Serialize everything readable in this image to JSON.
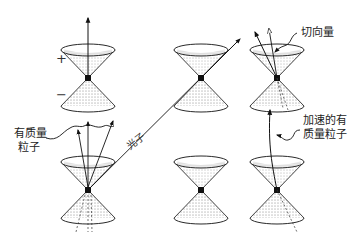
{
  "diagram": {
    "type": "light-cone-diagram",
    "labels": {
      "future_sign": "+",
      "past_sign": "−",
      "massive_particle_line1": "有质量",
      "massive_particle_line2": "粒子",
      "photon": "光子",
      "tangent_vector": "切向量",
      "accelerated_line1": "加速的有",
      "accelerated_line2": "质量粒子"
    },
    "cones": [
      {
        "id": "top-left",
        "vertex": [
          88,
          78
        ]
      },
      {
        "id": "top-middle",
        "vertex": [
          201,
          78
        ]
      },
      {
        "id": "top-right",
        "vertex": [
          277,
          78
        ]
      },
      {
        "id": "bottom-left",
        "vertex": [
          88,
          190
        ]
      },
      {
        "id": "bottom-middle",
        "vertex": [
          201,
          190
        ]
      },
      {
        "id": "bottom-right",
        "vertex": [
          277,
          190
        ]
      }
    ],
    "colors": {
      "ink": "#111111",
      "stipple": "#555555",
      "background": "#ffffff"
    }
  }
}
